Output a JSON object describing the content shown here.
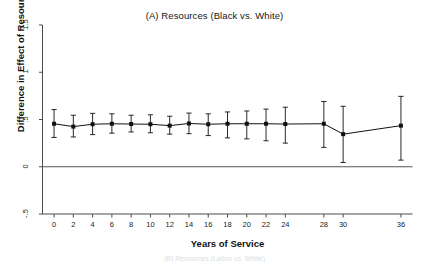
{
  "chart_data": {
    "type": "line",
    "title": "(A) Resources (Black vs. White)",
    "xlabel": "Years of Service",
    "ylabel": "Difference in Effect of Resources",
    "xlim": [
      -1.2,
      37.2
    ],
    "ylim": [
      -0.5,
      1.5
    ],
    "xticks": [
      0,
      2,
      4,
      6,
      8,
      10,
      12,
      14,
      16,
      18,
      20,
      22,
      24,
      28,
      30,
      36
    ],
    "xtick_labels": [
      "0",
      "2",
      "4",
      "6",
      "8",
      "10",
      "12",
      "14",
      "16",
      "18",
      "20",
      "22",
      "24",
      "28",
      "30",
      "36"
    ],
    "yticks": [
      -0.5,
      0,
      0.5,
      1,
      1.5
    ],
    "ytick_labels": [
      "-.5",
      "0",
      ".5",
      "1",
      "1.5"
    ],
    "grid": false,
    "legend": null,
    "reference_line": {
      "y": 0,
      "color": "#555555"
    },
    "series": [
      {
        "name": "Difference in Effect of Resources (Black vs. White)",
        "marker": "filled-square",
        "color": "#111111",
        "error_bar_style": "capped-95ci",
        "x": [
          0,
          2,
          4,
          6,
          8,
          10,
          12,
          14,
          16,
          18,
          20,
          22,
          24,
          28,
          30,
          36
        ],
        "values": [
          0.455,
          0.425,
          0.45,
          0.455,
          0.452,
          0.45,
          0.435,
          0.458,
          0.45,
          0.455,
          0.455,
          0.455,
          0.452,
          0.455,
          0.345,
          0.435
        ],
        "ci_low": [
          0.31,
          0.315,
          0.34,
          0.355,
          0.368,
          0.36,
          0.345,
          0.35,
          0.33,
          0.305,
          0.295,
          0.275,
          0.25,
          0.205,
          0.045,
          0.07
        ],
        "ci_high": [
          0.605,
          0.545,
          0.565,
          0.56,
          0.545,
          0.55,
          0.535,
          0.568,
          0.56,
          0.58,
          0.59,
          0.61,
          0.63,
          0.69,
          0.64,
          0.745
        ]
      }
    ]
  },
  "footer": {
    "ghost_text": "(B) Resources (Latino vs. White)"
  }
}
